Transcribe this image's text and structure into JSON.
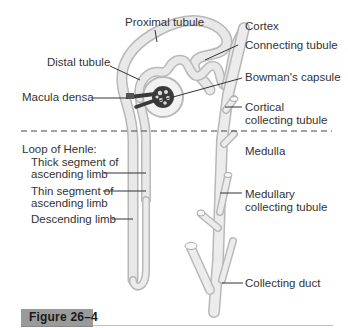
{
  "figure": {
    "caption": "Figure 26–4",
    "title_line": ""
  },
  "regions": {
    "cortex": "Cortex",
    "medulla": "Medulla",
    "boundary": "dashed line"
  },
  "labels": {
    "proximal_tubule": "Proximal tubule",
    "distal_tubule": "Distal tubule",
    "macula_densa": "Macula densa",
    "connecting_tubule": "Connecting tubule",
    "bowmans_capsule": "Bowman's capsule",
    "cortical_collecting_1": "Cortical",
    "cortical_collecting_2": "collecting tubule",
    "loop_of_henle": "Loop of Henle:",
    "thick_segment_1": "Thick segment of",
    "thick_segment_2": "ascending limb",
    "thin_segment_1": "Thin segment of",
    "thin_segment_2": "ascending limb",
    "descending_limb": "Descending limb",
    "medullary_collecting_1": "Medullary",
    "medullary_collecting_2": "collecting tubule",
    "collecting_duct": "Collecting duct"
  },
  "colors": {
    "tubule_fill": "#e6e6e6",
    "tubule_edge": "#b8b8b8",
    "glomerulus": "#3a3a3a",
    "leader": "#333333",
    "caption_bg": "#9a9a9a"
  }
}
